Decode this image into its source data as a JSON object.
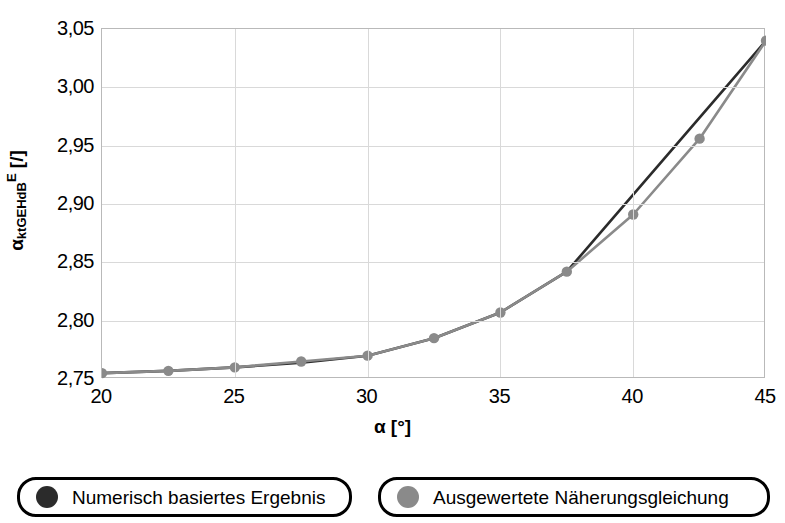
{
  "axes": {
    "y_title_base": "α",
    "y_title_sub": "ktGEHdB",
    "y_title_sup": "E",
    "y_title_unit": "[/]",
    "x_title": "α [°]",
    "yticks": [
      "3,05",
      "3,00",
      "2,95",
      "2,90",
      "2,85",
      "2,80",
      "2,75"
    ],
    "xticks": [
      "20",
      "25",
      "30",
      "35",
      "40",
      "45"
    ]
  },
  "legend": {
    "items": [
      {
        "label": "Numerisch basiertes Ergebnis",
        "color": "#2b2b2b"
      },
      {
        "label": "Ausgewertete Näherungsgleichung",
        "color": "#8a8a8a"
      }
    ]
  },
  "colors": {
    "numeric": "#2b2b2b",
    "approx": "#8a8a8a",
    "grid": "#d9d9d9",
    "frame": "#b9b9b9"
  },
  "chart_data": {
    "type": "line",
    "title": "",
    "xlabel": "α [°]",
    "ylabel": "α_ktGEHdB^E [/]",
    "xlim": [
      20,
      45
    ],
    "ylim": [
      2.75,
      3.05
    ],
    "xticks": [
      20,
      25,
      30,
      35,
      40,
      45
    ],
    "yticks": [
      2.75,
      2.8,
      2.85,
      2.9,
      2.95,
      3.0,
      3.05
    ],
    "grid": true,
    "legend_position": "bottom",
    "x": [
      20,
      22.5,
      25,
      27.5,
      30,
      32.5,
      35,
      37.5,
      40,
      42.5,
      45
    ],
    "series": [
      {
        "name": "Numerisch basiertes Ergebnis",
        "color": "#2b2b2b",
        "values": [
          2.755,
          2.757,
          2.76,
          2.764,
          2.77,
          2.785,
          2.807,
          2.842,
          2.908,
          2.974,
          3.04
        ]
      },
      {
        "name": "Ausgewertete Näherungsgleichung",
        "color": "#8a8a8a",
        "values": [
          2.755,
          2.757,
          2.76,
          2.765,
          2.77,
          2.785,
          2.807,
          2.842,
          2.891,
          2.956,
          3.04
        ]
      }
    ],
    "markers_series": "Ausgewertete Näherungsgleichung"
  }
}
